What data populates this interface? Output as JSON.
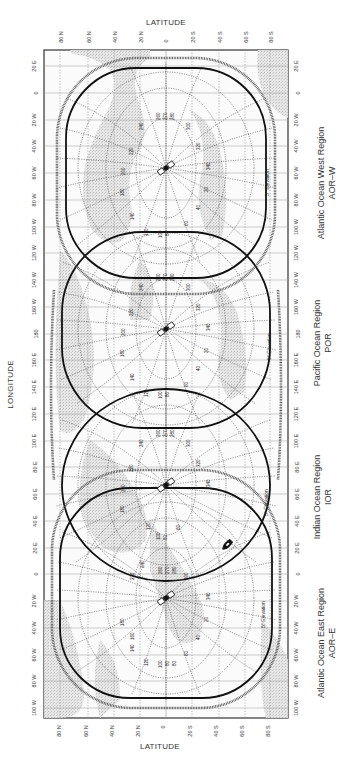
{
  "axes": {
    "latitude_label": "LATITUDE",
    "longitude_label": "LONGITUDE",
    "latitude_ticks": [
      "80 N",
      "60 N",
      "40 N",
      "20 N",
      "0",
      "20 S",
      "40 S",
      "60 S",
      "80 S"
    ],
    "longitude_ticks": [
      "20 E",
      "0",
      "20 W",
      "40 W",
      "60 W",
      "80 W",
      "100 W",
      "120 W",
      "140 W",
      "160 W",
      "180",
      "160 E",
      "140 E",
      "120 E",
      "100 E",
      "80 E",
      "60 E",
      "40 E",
      "20 E",
      "0",
      "20 W",
      "40 W",
      "60 W",
      "80 W",
      "100 W"
    ]
  },
  "regions": [
    {
      "name": "Atlantic Ocean West Region",
      "code": "AOR–W",
      "satellite_longitude": "54 W",
      "elevation_label": "5° Elevation"
    },
    {
      "name": "Pacific Ocean Region",
      "code": "POR",
      "satellite_longitude": "178 E",
      "elevation_label": "5° Elevation"
    },
    {
      "name": "Indian Ocean Region",
      "code": "IOR",
      "satellite_longitude": "64 E",
      "elevation_label": "5° Elevation"
    },
    {
      "name": "Atlantic Ocean East Region",
      "code": "AOR–E",
      "satellite_longitude": "15.5 W",
      "elevation_label": "5° Elevation"
    }
  ],
  "azimuth_labels": [
    "100",
    "80",
    "60",
    "40",
    "20",
    "340",
    "320",
    "300",
    "280",
    "270",
    "260",
    "240",
    "220",
    "200",
    "180",
    "160",
    "140",
    "120"
  ],
  "colors": {
    "frame": "#333333",
    "footprint": "#111111",
    "grid": "#888888",
    "land": "#cfcfcf",
    "background": "#ffffff"
  }
}
